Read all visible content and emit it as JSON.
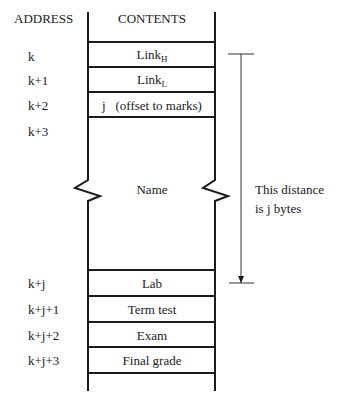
{
  "headers": {
    "address": "ADDRESS",
    "contents": "CONTENTS"
  },
  "rows": [
    {
      "address": "k",
      "content": "Link",
      "sub": "H"
    },
    {
      "address": "k+1",
      "content": "Link",
      "sub": "L"
    },
    {
      "address": "k+2",
      "content": "j   (offset to marks)"
    },
    {
      "address": "k+3",
      "content": ""
    },
    {
      "address": "",
      "content": "Name"
    },
    {
      "address": "k+j",
      "content": "Lab"
    },
    {
      "address": "k+j+1",
      "content": "Term test"
    },
    {
      "address": "k+j+2",
      "content": "Exam"
    },
    {
      "address": "k+j+3",
      "content": "Final grade"
    }
  ],
  "dimension": {
    "line1": "This distance",
    "line2": "is j bytes"
  }
}
